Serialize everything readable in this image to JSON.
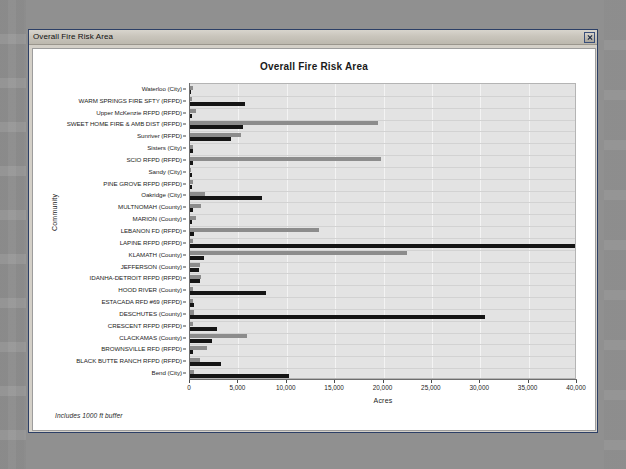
{
  "window": {
    "title": "Overall Fire Risk Area",
    "close_icon": "close-icon"
  },
  "chart_data": {
    "type": "bar",
    "orientation": "horizontal",
    "title": "Overall Fire Risk Area",
    "xlabel": "Acres",
    "ylabel": "Community",
    "footnote": "Includes 1000 ft buffer",
    "xlim": [
      0,
      40000
    ],
    "xticks": [
      0,
      5000,
      10000,
      15000,
      20000,
      25000,
      30000,
      35000,
      40000
    ],
    "xtick_labels": [
      "0",
      "5,000",
      "10,000",
      "15,000",
      "20,000",
      "25,000",
      "30,000",
      "35,000",
      "40,000"
    ],
    "grid": "vertical-and-horizontal",
    "legend": "none",
    "colors": {
      "series_1": "#151515",
      "series_2": "#8c8c8c",
      "plot_background": "#e3e3e3"
    },
    "categories": [
      "Waterloo (City)",
      "WARM SPRINGS FIRE SFTY (RFPD)",
      "Upper McKenzie RFPD (RFPD)",
      "SWEET HOME FIRE & AMB DIST (RFPD)",
      "Sunriver (RFPD)",
      "Sisters (City)",
      "SCIO RFPD (RFPD)",
      "Sandy (City)",
      "PINE GROVE RFPD (RFPD)",
      "Oakridge (City)",
      "MULTNOMAH (County)",
      "MARION (County)",
      "LEBANON FD (RFPD)",
      "LAPINE RFPD (RFPD)",
      "KLAMATH (County)",
      "JEFFERSON (County)",
      "IDANHA-DETROIT RFPD (RFPD)",
      "HOOD RIVER (County)",
      "ESTACADA RFD #69 (RFPD)",
      "DESCHUTES (County)",
      "CRESCENT RFPD (RFPD)",
      "CLACKAMAS (County)",
      "BROWNSVILLE RFD (RFPD)",
      "BLACK BUTTE RANCH RFPD (RFPD)",
      "Bend (City)"
    ],
    "series": [
      {
        "name": "series_1",
        "color": "#151515",
        "values": [
          130,
          5700,
          250,
          5450,
          4200,
          260,
          330,
          170,
          220,
          7400,
          330,
          200,
          430,
          40000,
          1400,
          940,
          1000,
          7900,
          430,
          30500,
          2800,
          2300,
          280,
          3200,
          10200
        ]
      },
      {
        "name": "series_2",
        "color": "#8c8c8c",
        "values": [
          300,
          210,
          580,
          19400,
          5280,
          300,
          19700,
          140,
          350,
          1560,
          1100,
          600,
          13300,
          300,
          22400,
          1050,
          1150,
          260,
          340,
          430,
          340,
          5900,
          1800,
          1000,
          420
        ]
      }
    ]
  }
}
